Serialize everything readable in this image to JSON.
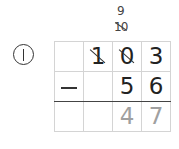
{
  "problem": {
    "number_label": "①",
    "operation": "subtraction",
    "operator_symbol": "−",
    "minuend_digits": [
      "",
      "1",
      "0",
      "3"
    ],
    "subtrahend_digits": [
      "",
      "",
      "5",
      "6"
    ],
    "answer_digits": [
      "",
      "",
      "4",
      "7"
    ],
    "crossed_out_columns": [
      1,
      2
    ],
    "borrow_marks": {
      "tens_column_borrowed": "10",
      "tens_column_after": "9"
    }
  },
  "colors": {
    "ink": "#222222",
    "answer_gray": "#a0a0a0",
    "grid_line": "#d4d4d4",
    "rule_line": "#444444"
  }
}
